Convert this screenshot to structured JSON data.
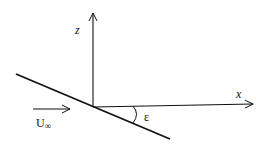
{
  "diagram": {
    "axes": {
      "x_label": "x",
      "z_label": "z"
    },
    "flow": {
      "label_main": "U",
      "label_sub": "∞"
    },
    "angle": {
      "label": "ε"
    },
    "colors": {
      "stroke": "#111111",
      "background": "#ffffff"
    }
  }
}
